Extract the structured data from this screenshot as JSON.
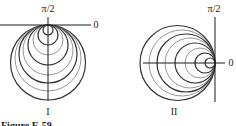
{
  "figure": {
    "caption": "Figure E-59",
    "panels": [
      {
        "id": "I",
        "label": "I",
        "axis_label_top": "π/2",
        "axis_label_right": "0",
        "origin": [
          48,
          25
        ],
        "direction": "down",
        "circle_diameters": [
          10,
          20,
          30,
          40,
          50,
          58,
          66,
          75
        ]
      },
      {
        "id": "II",
        "label": "II",
        "axis_label_top": "π/2",
        "axis_label_right": "0",
        "origin": [
          215,
          63
        ],
        "direction": "left",
        "circle_diameters": [
          10,
          20,
          30,
          40,
          50,
          58,
          66,
          75
        ]
      }
    ]
  },
  "colors": {
    "axis": "#1a1a1a",
    "circle_dark": "#333333",
    "circle_light": "#8a8a8a"
  }
}
